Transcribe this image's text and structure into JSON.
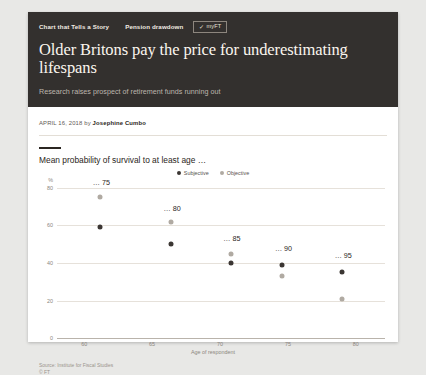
{
  "article": {
    "kicker_series": "Chart that Tells a Story",
    "kicker_topic": "Pension drawdown",
    "myft_label": "myFT",
    "myft_tick": "✓",
    "headline": "Older Britons pay the price for underestimating lifespans",
    "standfirst": "Research raises prospect of retirement funds running out",
    "byline_date": "APRIL 16, 2018",
    "byline_by": "by",
    "byline_author": "Josephine Cumbo"
  },
  "colors": {
    "masthead_bg": "#33302e",
    "subjective": "#3b3633",
    "objective": "#b0aaa2",
    "page_bg": "#e8e8e6"
  },
  "footer": {
    "source": "Source: Institute for Fiscal Studies",
    "copyright": "© FT"
  },
  "chart_data": {
    "type": "scatter",
    "title": "Mean probability of survival to at least age …",
    "xlabel": "Age of respondent",
    "ylabel": "%",
    "xlim": [
      58,
      82
    ],
    "ylim": [
      0,
      85
    ],
    "xticks": [
      60,
      65,
      70,
      75,
      80
    ],
    "yticks": [
      0,
      20,
      40,
      60,
      80
    ],
    "grid": true,
    "legend_position": "top-center",
    "annotations": [
      {
        "label": "… 75",
        "x": 61.2,
        "y": 80
      },
      {
        "label": "… 80",
        "x": 66.4,
        "y": 66
      },
      {
        "label": "… 85",
        "x": 70.8,
        "y": 50
      },
      {
        "label": "… 90",
        "x": 74.6,
        "y": 45
      },
      {
        "label": "… 95",
        "x": 79.0,
        "y": 41
      }
    ],
    "series": [
      {
        "name": "Subjective",
        "color": "#3b3633",
        "points": [
          {
            "x": 61.2,
            "y": 59
          },
          {
            "x": 66.4,
            "y": 50
          },
          {
            "x": 70.8,
            "y": 40
          },
          {
            "x": 74.6,
            "y": 39
          },
          {
            "x": 79.0,
            "y": 35
          }
        ]
      },
      {
        "name": "Objective",
        "color": "#b0aaa2",
        "points": [
          {
            "x": 61.2,
            "y": 75
          },
          {
            "x": 66.4,
            "y": 62
          },
          {
            "x": 70.8,
            "y": 45
          },
          {
            "x": 74.6,
            "y": 33
          },
          {
            "x": 79.0,
            "y": 21
          }
        ]
      }
    ]
  }
}
